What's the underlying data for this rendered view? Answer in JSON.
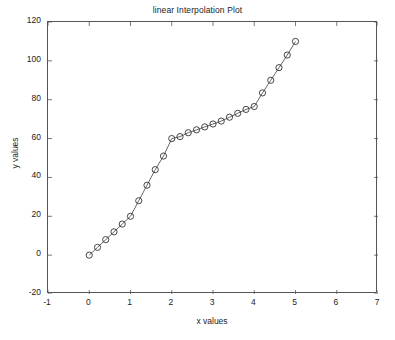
{
  "chart_data": {
    "type": "line",
    "title": "linear Interpolation Plot",
    "xlabel": "x values",
    "ylabel": "y values",
    "xlim": [
      -1,
      7
    ],
    "ylim": [
      -20,
      120
    ],
    "xticks": [
      -1,
      0,
      1,
      2,
      3,
      4,
      5,
      6,
      7
    ],
    "yticks": [
      -20,
      0,
      20,
      40,
      60,
      80,
      100,
      120
    ],
    "xtick_labels": [
      "-1",
      "0",
      "1",
      "2",
      "3",
      "4",
      "5",
      "6",
      "7"
    ],
    "ytick_labels": [
      "-20",
      "0",
      "20",
      "40",
      "60",
      "80",
      "100",
      "120"
    ],
    "grid": false,
    "legend": null,
    "marker": "circle-open",
    "line_color": "#555555",
    "marker_color": "#333333",
    "series": [
      {
        "name": "linear interpolation",
        "x": [
          0,
          0.2,
          0.4,
          0.6,
          0.8,
          1.0,
          1.2,
          1.4,
          1.6,
          1.8,
          2.0,
          2.2,
          2.4,
          2.6,
          2.8,
          3.0,
          3.2,
          3.4,
          3.6,
          3.8,
          4.0,
          4.2,
          4.4,
          4.6,
          4.8,
          5.0
        ],
        "y": [
          0,
          4,
          8,
          12,
          16,
          20,
          28,
          36,
          44,
          51,
          60,
          61,
          63,
          64.5,
          66,
          67.5,
          69,
          71,
          73,
          75,
          76.5,
          83.5,
          90,
          96.5,
          103,
          110
        ]
      }
    ]
  },
  "figure": {
    "background": "#ffffff",
    "axis_color": "#555555"
  }
}
